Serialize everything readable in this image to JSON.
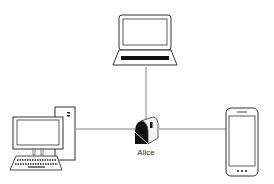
{
  "diagram": {
    "type": "network",
    "nodes": [
      {
        "id": "laptop",
        "icon": "laptop-icon",
        "label": ""
      },
      {
        "id": "mailbox",
        "icon": "mailbox-icon",
        "label": "Alice"
      },
      {
        "id": "desktop",
        "icon": "desktop-computer-icon",
        "label": ""
      },
      {
        "id": "phone",
        "icon": "smartphone-icon",
        "label": ""
      }
    ],
    "edges": [
      {
        "from": "laptop",
        "to": "mailbox"
      },
      {
        "from": "desktop",
        "to": "mailbox"
      },
      {
        "from": "mailbox",
        "to": "phone"
      }
    ]
  },
  "labels": {
    "mailbox": "Alice"
  },
  "colors": {
    "line": "#555555",
    "stroke": "#333333",
    "fill": "#ffffff"
  }
}
